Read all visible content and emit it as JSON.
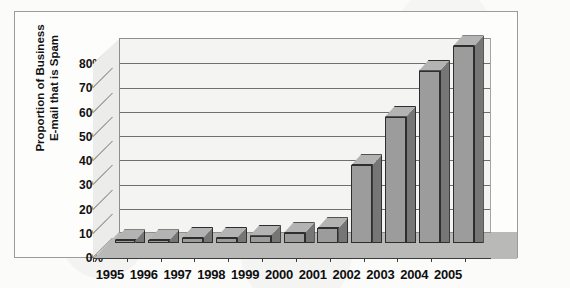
{
  "chart_data": {
    "type": "bar",
    "title": "",
    "xlabel": "",
    "ylabel": "Proportion of Business E-mail that is Spam",
    "ylabel_line1": "Proportion of Business",
    "ylabel_line2": "E-mail that is Spam",
    "categories": [
      "1995",
      "1996",
      "1997",
      "1998",
      "1999",
      "2000",
      "2001",
      "2002",
      "2003",
      "2004",
      "2005"
    ],
    "values": [
      1,
      1,
      2,
      2,
      3,
      4,
      6,
      32,
      52,
      71,
      81
    ],
    "ylim": [
      0,
      80
    ],
    "ytick_values": [
      0,
      10,
      20,
      30,
      40,
      50,
      60,
      70,
      80
    ],
    "ytick_labels": [
      "0%",
      "10%",
      "20%",
      "30%",
      "40%",
      "50%",
      "60%",
      "70%",
      "80%"
    ],
    "grid": true,
    "legend": false,
    "legend_position": "none",
    "three_d": true,
    "colors": {
      "bar_front": "#9c9c9c",
      "bar_side": "#767676",
      "bar_top": "#b3b3b3",
      "bar_outline": "#2e2e2e",
      "wall_back": "#f4f4f2",
      "wall_left": "#ececeb",
      "floor": "#b9b9b7",
      "gridline": "#6f6f6f",
      "frame": "#9b9b9b",
      "text": "#111111",
      "page_background": "#fbfbfa"
    }
  }
}
